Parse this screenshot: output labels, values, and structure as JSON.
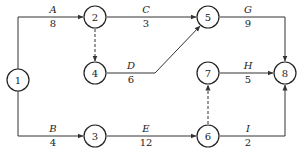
{
  "diagram": {
    "type": "activity-on-arrow network",
    "nodes": [
      {
        "id": "1",
        "label": "1"
      },
      {
        "id": "2",
        "label": "2"
      },
      {
        "id": "3",
        "label": "3"
      },
      {
        "id": "4",
        "label": "4"
      },
      {
        "id": "5",
        "label": "5"
      },
      {
        "id": "6",
        "label": "6"
      },
      {
        "id": "7",
        "label": "7"
      },
      {
        "id": "8",
        "label": "8"
      }
    ],
    "activities": [
      {
        "name": "A",
        "duration": "8",
        "from": "1",
        "to": "2"
      },
      {
        "name": "B",
        "duration": "4",
        "from": "1",
        "to": "3"
      },
      {
        "name": "C",
        "duration": "3",
        "from": "2",
        "to": "5"
      },
      {
        "name": "D",
        "duration": "6",
        "from": "4",
        "to": "5"
      },
      {
        "name": "E",
        "duration": "12",
        "from": "3",
        "to": "6"
      },
      {
        "name": "G",
        "duration": "9",
        "from": "5",
        "to": "8"
      },
      {
        "name": "H",
        "duration": "5",
        "from": "7",
        "to": "8"
      },
      {
        "name": "I",
        "duration": "2",
        "from": "6",
        "to": "8"
      }
    ],
    "dummy_activities": [
      {
        "from": "2",
        "to": "4"
      },
      {
        "from": "6",
        "to": "7"
      }
    ]
  }
}
